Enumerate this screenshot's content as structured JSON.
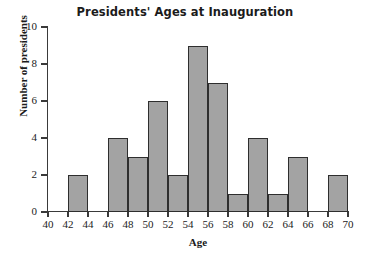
{
  "chart_data": {
    "type": "bar",
    "title": "Presidents' Ages at Inauguration",
    "xlabel": "Age",
    "ylabel": "Number of presidents",
    "grid": false,
    "legend": null,
    "bin_width": 2,
    "xlim": [
      40,
      70
    ],
    "ylim": [
      0,
      10
    ],
    "xticks": [
      40,
      42,
      44,
      46,
      48,
      50,
      52,
      54,
      56,
      58,
      60,
      62,
      64,
      66,
      68,
      70
    ],
    "yticks": [
      0,
      2,
      4,
      6,
      8,
      10
    ],
    "categories": [
      "40-42",
      "42-44",
      "44-46",
      "46-48",
      "48-50",
      "50-52",
      "52-54",
      "54-56",
      "56-58",
      "58-60",
      "60-62",
      "62-64",
      "64-66",
      "66-68",
      "68-70"
    ],
    "bin_starts": [
      40,
      42,
      44,
      46,
      48,
      50,
      52,
      54,
      56,
      58,
      60,
      62,
      64,
      66,
      68
    ],
    "values": [
      0,
      2,
      0,
      4,
      3,
      6,
      2,
      9,
      7,
      1,
      4,
      1,
      3,
      0,
      2
    ],
    "colors": {
      "bar_fill": "#a3a3a3",
      "bar_edge": "#2e2e2e",
      "axis": "#3a3a3a",
      "text": "#1b1b1b",
      "background": "#ffffff"
    }
  }
}
